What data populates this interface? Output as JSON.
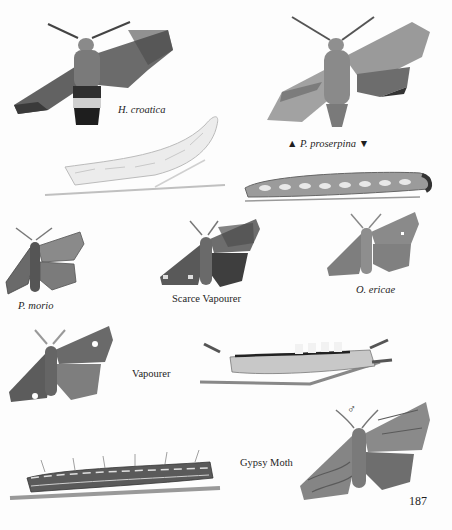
{
  "page": {
    "number": "187",
    "background": "#fdfdfd",
    "ink_color": "#1e1e1e"
  },
  "labels": {
    "h_croatica": "H. croatica",
    "p_proserpina": "▲ P. proserpina ▼",
    "p_morio": "P. morio",
    "scarce_vapourer": "Scarce Vapourer",
    "o_ericae": "O. ericae",
    "vapourer": "Vapourer",
    "gypsy_moth": "Gypsy Moth",
    "male_symbol": "♂"
  },
  "illustrations": [
    {
      "id": "h-croatica-adult",
      "type": "moth",
      "caption_ref": "h_croatica"
    },
    {
      "id": "h-croatica-larva",
      "type": "caterpillar",
      "caption_ref": "h_croatica"
    },
    {
      "id": "p-proserpina-adult",
      "type": "moth",
      "caption_ref": "p_proserpina"
    },
    {
      "id": "p-proserpina-larva",
      "type": "caterpillar",
      "caption_ref": "p_proserpina"
    },
    {
      "id": "p-morio-adult",
      "type": "moth",
      "caption_ref": "p_morio"
    },
    {
      "id": "scarce-vapourer-adult",
      "type": "moth",
      "caption_ref": "scarce_vapourer"
    },
    {
      "id": "o-ericae-adult",
      "type": "moth",
      "caption_ref": "o_ericae"
    },
    {
      "id": "vapourer-adult",
      "type": "moth",
      "caption_ref": "vapourer"
    },
    {
      "id": "vapourer-larva",
      "type": "caterpillar",
      "caption_ref": "vapourer"
    },
    {
      "id": "gypsy-moth-larva",
      "type": "caterpillar",
      "caption_ref": "gypsy_moth"
    },
    {
      "id": "gypsy-moth-male-adult",
      "type": "moth",
      "caption_ref": "gypsy_moth"
    }
  ]
}
